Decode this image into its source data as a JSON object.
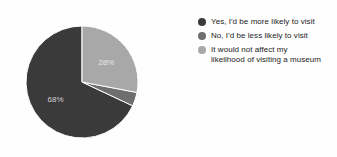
{
  "chart_data": {
    "type": "pie",
    "title": "",
    "categories": [
      "Yes, I'd be more likely to visit",
      "No, I'd be less likely to visit",
      "It would not affect my likelihood of visiting a museum"
    ],
    "values": [
      68,
      4,
      28
    ],
    "value_labels": [
      "68%",
      "",
      "28%"
    ],
    "colors": [
      "#3a3a3a",
      "#6e6e6e",
      "#a8a8a8"
    ],
    "units": "percent",
    "legend_position": "right",
    "grid": false,
    "start_angle_deg": -90,
    "direction": "counterclockwise",
    "slices": [
      {
        "label": "Yes, I'd be more likely to visit",
        "value": 68,
        "display": "68%",
        "color": "#3a3a3a",
        "show_label": true
      },
      {
        "label": "No, I'd be less likely to visit",
        "value": 4,
        "display": "",
        "color": "#6e6e6e",
        "show_label": false
      },
      {
        "label": "It would not affect my likelihood of visiting a museum",
        "value": 28,
        "display": "28%",
        "color": "#a8a8a8",
        "show_label": true
      }
    ]
  },
  "legend": {
    "items": [
      {
        "label": "Yes, I'd be more likely to visit",
        "color": "#3a3a3a"
      },
      {
        "label": "No, I'd be less likely to visit",
        "color": "#6e6e6e"
      },
      {
        "label": "It would not affect my\nlikelihood of visiting a museum",
        "color": "#a8a8a8"
      }
    ]
  },
  "labels": {
    "slice_one": "68%",
    "slice_three": "28%"
  }
}
